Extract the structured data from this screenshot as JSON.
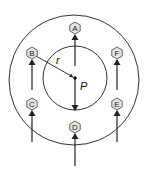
{
  "diagram": {
    "title": "",
    "colors": {
      "stroke": "#333333",
      "hex_fill": "#e4e4e4",
      "background": "#ffffff"
    },
    "outer_circle": {
      "cx": 74,
      "cy": 80,
      "r": 65
    },
    "inner_circle": {
      "cx": 75,
      "cy": 78,
      "r": 32
    },
    "center_point": {
      "label": "P",
      "x": 75,
      "y": 78
    },
    "radius_label": "r",
    "nodes": [
      {
        "id": "A",
        "label": "A",
        "x": 75,
        "y": 28
      },
      {
        "id": "B",
        "label": "B",
        "x": 32,
        "y": 53
      },
      {
        "id": "C",
        "label": "C",
        "x": 32,
        "y": 104
      },
      {
        "id": "D",
        "label": "D",
        "x": 75,
        "y": 127
      },
      {
        "id": "E",
        "label": "E",
        "x": 117,
        "y": 104
      },
      {
        "id": "F",
        "label": "F",
        "x": 117,
        "y": 53
      }
    ],
    "arrows": [
      {
        "name": "arrow-to-A",
        "x1": 75,
        "y1": 66,
        "x2": 75,
        "y2": 35,
        "direction": "up"
      },
      {
        "name": "arrow-to-B",
        "x1": 32,
        "y1": 90,
        "x2": 32,
        "y2": 60,
        "direction": "up"
      },
      {
        "name": "arrow-to-C",
        "x1": 32,
        "y1": 142,
        "x2": 32,
        "y2": 111,
        "direction": "up"
      },
      {
        "name": "arrow-to-D",
        "x1": 75,
        "y1": 166,
        "x2": 75,
        "y2": 134,
        "direction": "up"
      },
      {
        "name": "arrow-to-E",
        "x1": 117,
        "y1": 142,
        "x2": 117,
        "y2": 111,
        "direction": "up"
      },
      {
        "name": "arrow-to-F",
        "x1": 117,
        "y1": 90,
        "x2": 117,
        "y2": 60,
        "direction": "up"
      },
      {
        "name": "arrow-from-P-down",
        "x1": 75,
        "y1": 79,
        "x2": 75,
        "y2": 110,
        "direction": "down"
      }
    ]
  }
}
